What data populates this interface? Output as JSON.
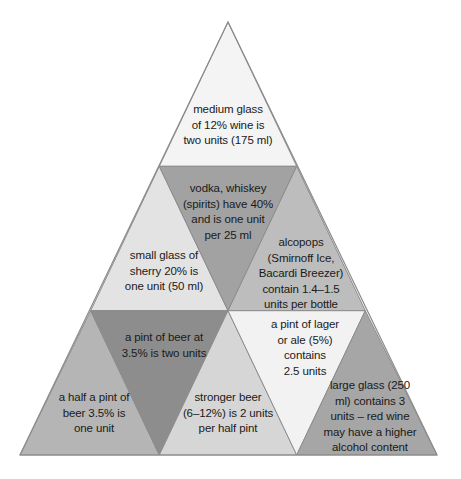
{
  "diagram": {
    "shape": "triangle",
    "apex": {
      "x": 228,
      "y": 22
    },
    "base_left": {
      "x": 20,
      "y": 455
    },
    "base_right": {
      "x": 437,
      "y": 455
    },
    "background_color": "#ffffff",
    "outline_color": "#8c8c8c",
    "text_color": "#1a1a1a",
    "palette": {
      "lightest": "#f4f4f4",
      "light": "#e8e8e8",
      "medium_light": "#d9d9d9",
      "medium": "#bcbcbc",
      "medium_dark": "#a8a8a8",
      "dark": "#8f8f8f"
    },
    "cells": [
      {
        "id": "medium-glass-wine",
        "row": 1,
        "orientation": "up",
        "fill": "#f4f4f4",
        "text": "medium glass\nof 12% wine is\ntwo units (175 ml)"
      },
      {
        "id": "small-glass-sherry",
        "row": 2,
        "orientation": "up",
        "fill": "#e3e3e3",
        "text": "small glass of\nsherry 20% is\none unit (50 ml)"
      },
      {
        "id": "vodka-whiskey-spirits",
        "row": 2,
        "orientation": "down",
        "fill": "#a2a2a2",
        "text": "vodka, whiskey\n(spirits) have 40%\nand is one unit\nper 25 ml"
      },
      {
        "id": "alcopops",
        "row": 2,
        "orientation": "up",
        "fill": "#bdbdbd",
        "text": "alcopops\n(Smirnoff Ice,\nBacardi Breezer)\ncontain 1.4–1.5\nunits per bottle"
      },
      {
        "id": "half-pint-beer",
        "row": 3,
        "orientation": "up",
        "fill": "#b5b5b5",
        "text": "a half a pint of\nbeer 3.5% is\none unit"
      },
      {
        "id": "pint-of-beer",
        "row": 3,
        "orientation": "down",
        "fill": "#8d8d8d",
        "text": "a pint of beer at\n3.5% is two units"
      },
      {
        "id": "stronger-beer",
        "row": 3,
        "orientation": "up",
        "fill": "#d6d6d6",
        "text": "stronger beer\n(6–12%) is 2 units\nper half pint"
      },
      {
        "id": "pint-of-lager",
        "row": 3,
        "orientation": "down",
        "fill": "#f2f2f2",
        "text": "a pint of lager\nor ale (5%)\ncontains\n2.5 units"
      },
      {
        "id": "large-glass-wine",
        "row": 3,
        "orientation": "up",
        "fill": "#a6a6a6",
        "text": "large glass (250\nml) contains 3\nunits – red wine\nmay have a higher\nalcohol content"
      }
    ]
  }
}
